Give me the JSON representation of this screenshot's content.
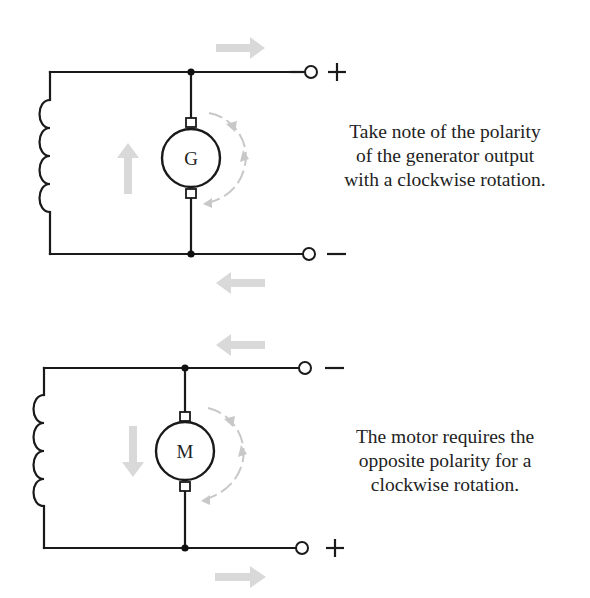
{
  "colors": {
    "wire": "#1a1a1a",
    "flow_arrow": "#d9d9d9",
    "rotation_arrow": "#c8c8c8",
    "text": "#222222",
    "background": "#ffffff"
  },
  "generator_circuit": {
    "machine_label": "G",
    "terminal_top_sign": "+",
    "terminal_bottom_sign": "−",
    "rotation": "clockwise",
    "field_current_arrow": "up",
    "top_line_arrow": "right",
    "bottom_line_arrow": "left",
    "caption_lines": [
      "Take note of the polarity",
      "of the generator output",
      "with a clockwise rotation."
    ]
  },
  "motor_circuit": {
    "machine_label": "M",
    "terminal_top_sign": "−",
    "terminal_bottom_sign": "+",
    "rotation": "clockwise",
    "field_current_arrow": "down",
    "top_line_arrow": "left",
    "bottom_line_arrow": "right",
    "caption_lines": [
      "The motor requires the",
      "opposite polarity for a",
      "clockwise rotation."
    ]
  }
}
